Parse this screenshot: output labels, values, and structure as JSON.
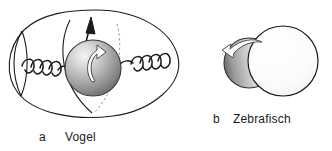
{
  "figure": {
    "background_color": "#ffffff",
    "stroke_color": "#1b1b1b"
  },
  "panels": [
    {
      "id": "a",
      "letter": "a",
      "name": "Vogel",
      "label_full": "a Vogel",
      "elements": {
        "egg_outline": "egg-outline",
        "yolk_sphere": "yolk-sphere",
        "left_chalaza": "left-chalaza-spiral",
        "right_chalaza": "right-chalaza-spiral",
        "axis_arrow": "axis-arrow",
        "rotation_arrow": "rotation-arrow",
        "meridian_solid": "meridian-arc-solid",
        "meridian_dashed": "meridian-arc-dashed",
        "left_lens": "left-lens-arc"
      },
      "colors": {
        "sphere_highlight": "#f2f2f2",
        "sphere_mid": "#b9b9b9",
        "sphere_shadow": "#6e6e6e",
        "outline": "#1b1b1b",
        "arrow_fill": "#ffffff"
      },
      "counts": {
        "left_spiral_loops": 4,
        "right_spiral_loops": 4
      }
    },
    {
      "id": "b",
      "letter": "b",
      "name": "Zebrafisch",
      "label_full": "b Zebrafisch",
      "elements": {
        "yolk_sphere": "yolk-sphere-large",
        "blastodisc": "blastodisc-sphere",
        "rotation_arrow": "rotation-arrow"
      },
      "colors": {
        "yolk_fill": "#fbfbfb",
        "blastodisc_highlight": "#fdfdfd",
        "blastodisc_mid": "#c9c9c9",
        "blastodisc_shadow": "#6b6b6b",
        "outline": "#1b1b1b",
        "arrow_fill": "#ffffff"
      }
    }
  ]
}
